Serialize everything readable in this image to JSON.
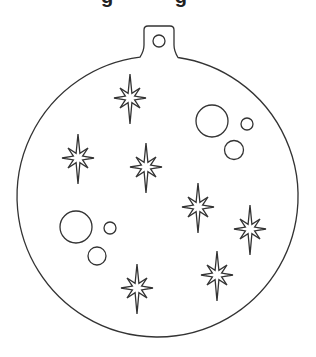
{
  "page": {
    "title_fragment": "g g"
  },
  "ornament": {
    "stroke_color": "#333333",
    "fill_color": "#ffffff",
    "body": {
      "cx": 157.5,
      "cy": 196.5,
      "r": 140.5
    },
    "hanger": {
      "x1": 144,
      "x2": 174,
      "top": 26,
      "hole": {
        "cx": 159,
        "cy": 41,
        "r": 6
      }
    },
    "stars": [
      {
        "cx": 130,
        "cy": 98
      },
      {
        "cx": 78,
        "cy": 158
      },
      {
        "cx": 146,
        "cy": 167
      },
      {
        "cx": 198,
        "cy": 207
      },
      {
        "cx": 250,
        "cy": 229
      },
      {
        "cx": 137,
        "cy": 288
      },
      {
        "cx": 217,
        "cy": 275
      }
    ],
    "circles": [
      {
        "cx": 212,
        "cy": 121,
        "r": 16
      },
      {
        "cx": 247,
        "cy": 124,
        "r": 6
      },
      {
        "cx": 234,
        "cy": 150,
        "r": 9.5
      },
      {
        "cx": 76,
        "cy": 227,
        "r": 16
      },
      {
        "cx": 110,
        "cy": 228,
        "r": 6
      },
      {
        "cx": 97,
        "cy": 256,
        "r": 9
      }
    ]
  }
}
